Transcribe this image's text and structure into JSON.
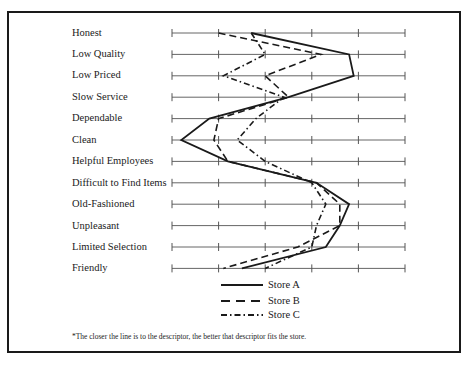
{
  "chart_data": {
    "type": "line",
    "title": "",
    "orientation": "horizontal profile (descriptors on rows, scale along x)",
    "xlabel": "",
    "ylabel": "",
    "xlim": [
      0,
      5
    ],
    "x_ticks": [
      0,
      1,
      2,
      3,
      4,
      5
    ],
    "grid": true,
    "legend_position": "bottom-center",
    "categories": [
      "Honest",
      "Low Quality",
      "Low Priced",
      "Slow Service",
      "Dependable",
      "Clean",
      "Helpful Employees",
      "Difficult to Find Items",
      "Old-Fashioned",
      "Unpleasant",
      "Limited Selection",
      "Friendly"
    ],
    "series": [
      {
        "name": "Store A",
        "style": "solid",
        "values": [
          1.7,
          3.8,
          3.9,
          2.5,
          0.8,
          0.2,
          1.2,
          3.1,
          3.8,
          3.6,
          3.3,
          1.5
        ]
      },
      {
        "name": "Store B",
        "style": "dashed",
        "values": [
          1.0,
          3.2,
          2.0,
          2.5,
          1.0,
          0.9,
          1.2,
          3.1,
          3.6,
          3.6,
          2.7,
          1.1
        ]
      },
      {
        "name": "Store C",
        "style": "dash-dot",
        "values": [
          1.7,
          2.0,
          1.1,
          2.4,
          1.8,
          1.4,
          2.0,
          3.0,
          3.3,
          3.1,
          3.0,
          2.0
        ]
      }
    ],
    "annotations": [
      "*The closer the line is to the descriptor, the better that descriptor fits the store."
    ]
  },
  "descriptors": [
    "Honest",
    "Low Quality",
    "Low Priced",
    "Slow Service",
    "Dependable",
    "Clean",
    "Helpful Employees",
    "Difficult to Find Items",
    "Old-Fashioned",
    "Unpleasant",
    "Limited Selection",
    "Friendly"
  ],
  "legend": {
    "store_a": "Store A",
    "store_b": "Store B",
    "store_c": "Store C"
  },
  "footnote": "*The closer the line is to the descriptor, the better that descriptor fits the store."
}
